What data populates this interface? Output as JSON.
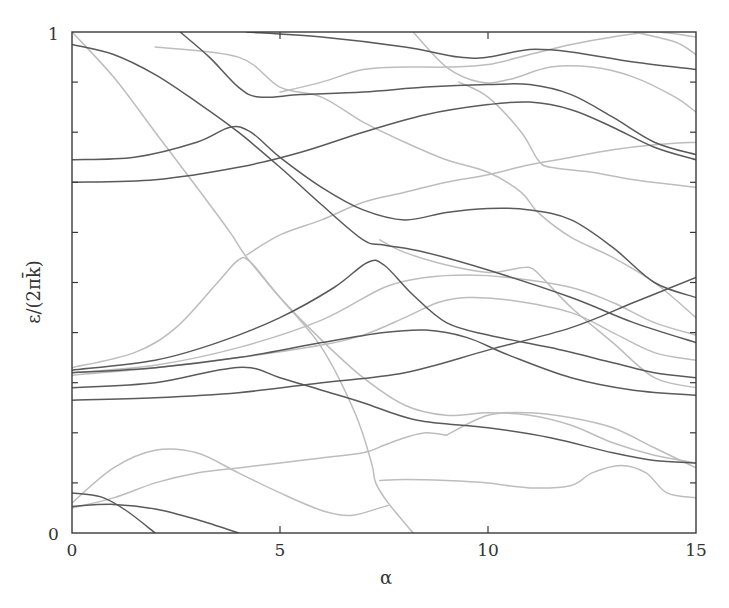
{
  "chart_data": {
    "type": "line",
    "title": "",
    "xlabel": "α",
    "ylabel": "ε/(2πk̄)",
    "xlim": [
      0,
      15
    ],
    "ylim": [
      0,
      1
    ],
    "x_ticks": [
      0,
      5,
      10,
      15
    ],
    "x_tick_labels": [
      "0",
      "5",
      "10",
      "15"
    ],
    "x_minor_ticks": [
      5,
      10
    ],
    "y_tick_labels": [
      "0",
      "1"
    ],
    "y_minor_ticks": [
      0.1,
      0.2,
      0.3,
      0.4,
      0.5,
      0.6,
      0.7,
      0.8,
      0.9
    ],
    "grid": false,
    "legend": null,
    "colors": {
      "dark": "#5a5a5a",
      "light": "#bdbdbd",
      "frame": "#3a3a3a"
    },
    "series": [
      {
        "name": "dark-1",
        "shade": "dark",
        "points": [
          [
            0,
            0.975
          ],
          [
            1,
            0.955
          ],
          [
            2,
            0.915
          ],
          [
            3,
            0.86
          ],
          [
            4,
            0.8
          ],
          [
            5,
            0.73
          ],
          [
            6,
            0.655
          ],
          [
            7,
            0.585
          ],
          [
            7.5,
            0.575
          ],
          [
            8.5,
            0.56
          ],
          [
            10,
            0.525
          ],
          [
            12,
            0.47
          ],
          [
            13.5,
            0.42
          ],
          [
            15,
            0.38
          ]
        ]
      },
      {
        "name": "dark-2",
        "shade": "dark",
        "points": [
          [
            2.6,
            1.0
          ],
          [
            3.3,
            0.95
          ],
          [
            4,
            0.89
          ],
          [
            4.5,
            0.87
          ],
          [
            5.5,
            0.875
          ],
          [
            7,
            0.88
          ],
          [
            8.5,
            0.89
          ],
          [
            10,
            0.895
          ],
          [
            11,
            0.895
          ],
          [
            12,
            0.875
          ],
          [
            13,
            0.83
          ],
          [
            14,
            0.78
          ],
          [
            15,
            0.755
          ]
        ]
      },
      {
        "name": "dark-3",
        "shade": "dark",
        "points": [
          [
            0,
            0.745
          ],
          [
            1.5,
            0.75
          ],
          [
            3,
            0.78
          ],
          [
            3.8,
            0.81
          ],
          [
            4.3,
            0.8
          ],
          [
            5,
            0.75
          ],
          [
            6,
            0.69
          ],
          [
            7,
            0.645
          ],
          [
            8,
            0.625
          ],
          [
            9,
            0.64
          ],
          [
            10,
            0.648
          ],
          [
            11,
            0.645
          ],
          [
            12,
            0.625
          ],
          [
            13,
            0.57
          ],
          [
            14,
            0.5
          ],
          [
            15,
            0.47
          ]
        ]
      },
      {
        "name": "dark-4",
        "shade": "dark",
        "points": [
          [
            0,
            0.7
          ],
          [
            2,
            0.705
          ],
          [
            4,
            0.73
          ],
          [
            5.5,
            0.76
          ],
          [
            7,
            0.8
          ],
          [
            8.5,
            0.835
          ],
          [
            10,
            0.855
          ],
          [
            11,
            0.86
          ],
          [
            12,
            0.845
          ],
          [
            13,
            0.81
          ],
          [
            14,
            0.77
          ],
          [
            15,
            0.745
          ]
        ]
      },
      {
        "name": "dark-5",
        "shade": "dark",
        "points": [
          [
            4.2,
            1.0
          ],
          [
            6,
            0.99
          ],
          [
            8,
            0.97
          ],
          [
            9.3,
            0.95
          ],
          [
            10,
            0.95
          ],
          [
            11,
            0.965
          ],
          [
            12,
            0.96
          ],
          [
            13.5,
            0.94
          ],
          [
            15,
            0.925
          ]
        ]
      },
      {
        "name": "dark-6",
        "shade": "dark",
        "points": [
          [
            0,
            0.325
          ],
          [
            2,
            0.345
          ],
          [
            3.5,
            0.38
          ],
          [
            5,
            0.43
          ],
          [
            6.3,
            0.49
          ],
          [
            7.1,
            0.54
          ],
          [
            7.5,
            0.535
          ],
          [
            8.2,
            0.475
          ],
          [
            9,
            0.42
          ],
          [
            10,
            0.395
          ],
          [
            11.5,
            0.37
          ],
          [
            13,
            0.34
          ],
          [
            14,
            0.32
          ],
          [
            15,
            0.31
          ]
        ]
      },
      {
        "name": "dark-7",
        "shade": "dark",
        "points": [
          [
            0,
            0.32
          ],
          [
            2,
            0.33
          ],
          [
            4,
            0.35
          ],
          [
            6,
            0.38
          ],
          [
            7.5,
            0.4
          ],
          [
            8.5,
            0.405
          ],
          [
            9.5,
            0.39
          ],
          [
            10.5,
            0.355
          ],
          [
            12,
            0.31
          ],
          [
            13.5,
            0.285
          ],
          [
            15,
            0.275
          ]
        ]
      },
      {
        "name": "dark-8",
        "shade": "dark",
        "points": [
          [
            0,
            0.29
          ],
          [
            2,
            0.3
          ],
          [
            3.5,
            0.325
          ],
          [
            4.3,
            0.33
          ],
          [
            5,
            0.31
          ],
          [
            6,
            0.285
          ],
          [
            7,
            0.26
          ],
          [
            8.3,
            0.225
          ],
          [
            10,
            0.21
          ],
          [
            11.5,
            0.19
          ],
          [
            13,
            0.16
          ],
          [
            14,
            0.145
          ],
          [
            15,
            0.14
          ]
        ]
      },
      {
        "name": "dark-9",
        "shade": "dark",
        "points": [
          [
            0,
            0.265
          ],
          [
            2,
            0.27
          ],
          [
            4,
            0.28
          ],
          [
            6,
            0.3
          ],
          [
            8,
            0.32
          ],
          [
            10,
            0.365
          ],
          [
            12,
            0.41
          ],
          [
            13.5,
            0.46
          ],
          [
            15,
            0.51
          ]
        ]
      },
      {
        "name": "dark-10",
        "shade": "dark",
        "points": [
          [
            0,
            0.08
          ],
          [
            0.7,
            0.072
          ],
          [
            1.3,
            0.045
          ],
          [
            2,
            0.0
          ]
        ]
      },
      {
        "name": "dark-11",
        "shade": "dark",
        "points": [
          [
            0,
            0.053
          ],
          [
            1,
            0.057
          ],
          [
            2,
            0.048
          ],
          [
            3,
            0.027
          ],
          [
            4,
            0.0
          ]
        ]
      },
      {
        "name": "light-1",
        "shade": "light",
        "points": [
          [
            0,
            1.0
          ],
          [
            1,
            0.91
          ],
          [
            2,
            0.8
          ],
          [
            3,
            0.69
          ],
          [
            3.8,
            0.6
          ],
          [
            4.2,
            0.55
          ],
          [
            5,
            0.47
          ],
          [
            6,
            0.37
          ],
          [
            6.8,
            0.24
          ],
          [
            7.2,
            0.14
          ],
          [
            7.3,
            0.1
          ],
          [
            7.6,
            0.06
          ],
          [
            8.2,
            0.0
          ]
        ]
      },
      {
        "name": "light-2",
        "shade": "light",
        "points": [
          [
            4.2,
            0.555
          ],
          [
            5,
            0.595
          ],
          [
            6,
            0.625
          ],
          [
            7,
            0.66
          ],
          [
            8,
            0.68
          ],
          [
            9,
            0.7
          ],
          [
            10,
            0.715
          ],
          [
            11,
            0.735
          ],
          [
            12,
            0.75
          ],
          [
            13,
            0.765
          ],
          [
            14,
            0.775
          ],
          [
            15,
            0.78
          ]
        ]
      },
      {
        "name": "light-3",
        "shade": "light",
        "points": [
          [
            0,
            0.33
          ],
          [
            1.5,
            0.36
          ],
          [
            2.5,
            0.41
          ],
          [
            3.5,
            0.5
          ],
          [
            4,
            0.545
          ],
          [
            4.3,
            0.54
          ],
          [
            5,
            0.47
          ],
          [
            6,
            0.385
          ],
          [
            7,
            0.31
          ],
          [
            8,
            0.255
          ],
          [
            9,
            0.235
          ],
          [
            10,
            0.24
          ],
          [
            11,
            0.235
          ],
          [
            12,
            0.215
          ],
          [
            13,
            0.18
          ],
          [
            14,
            0.155
          ],
          [
            15,
            0.14
          ]
        ]
      },
      {
        "name": "light-4",
        "shade": "light",
        "points": [
          [
            0,
            0.32
          ],
          [
            2,
            0.335
          ],
          [
            4,
            0.37
          ],
          [
            6,
            0.425
          ],
          [
            7.5,
            0.49
          ],
          [
            8.5,
            0.51
          ],
          [
            9.5,
            0.515
          ],
          [
            10.5,
            0.51
          ],
          [
            12,
            0.49
          ],
          [
            13,
            0.46
          ],
          [
            14,
            0.42
          ],
          [
            15,
            0.395
          ]
        ]
      },
      {
        "name": "light-5",
        "shade": "light",
        "points": [
          [
            0,
            0.315
          ],
          [
            2,
            0.33
          ],
          [
            4,
            0.35
          ],
          [
            6,
            0.375
          ],
          [
            7,
            0.395
          ],
          [
            8,
            0.43
          ],
          [
            8.8,
            0.46
          ],
          [
            9.5,
            0.47
          ],
          [
            10.5,
            0.465
          ],
          [
            12,
            0.44
          ],
          [
            13,
            0.4
          ],
          [
            14,
            0.36
          ],
          [
            15,
            0.345
          ]
        ]
      },
      {
        "name": "light-6",
        "shade": "light",
        "points": [
          [
            0,
            0.06
          ],
          [
            1,
            0.13
          ],
          [
            2,
            0.165
          ],
          [
            3,
            0.16
          ],
          [
            4,
            0.12
          ],
          [
            5,
            0.08
          ],
          [
            6,
            0.045
          ],
          [
            6.7,
            0.035
          ],
          [
            7.4,
            0.05
          ],
          [
            7.6,
            0.055
          ]
        ]
      },
      {
        "name": "light-7",
        "shade": "light",
        "points": [
          [
            0,
            0.05
          ],
          [
            1,
            0.07
          ],
          [
            2,
            0.1
          ],
          [
            3,
            0.12
          ],
          [
            4,
            0.13
          ],
          [
            5,
            0.14
          ],
          [
            6,
            0.15
          ],
          [
            7,
            0.16
          ],
          [
            7.5,
            0.175
          ],
          [
            8,
            0.19
          ],
          [
            8.5,
            0.2
          ],
          [
            9,
            0.195
          ]
        ]
      },
      {
        "name": "light-8",
        "shade": "light",
        "points": [
          [
            7.4,
            0.105
          ],
          [
            8,
            0.107
          ],
          [
            9,
            0.105
          ],
          [
            10,
            0.1
          ],
          [
            11,
            0.09
          ],
          [
            12,
            0.095
          ],
          [
            12.5,
            0.12
          ],
          [
            13.2,
            0.135
          ],
          [
            13.8,
            0.12
          ],
          [
            14.3,
            0.08
          ],
          [
            15,
            0.07
          ]
        ]
      },
      {
        "name": "light-9",
        "shade": "light",
        "points": [
          [
            9,
            0.195
          ],
          [
            10,
            0.235
          ],
          [
            11,
            0.24
          ],
          [
            12,
            0.23
          ],
          [
            13,
            0.21
          ],
          [
            14,
            0.17
          ],
          [
            15,
            0.13
          ]
        ]
      },
      {
        "name": "light-10",
        "shade": "light",
        "points": [
          [
            7.4,
            0.585
          ],
          [
            8,
            0.56
          ],
          [
            9,
            0.535
          ],
          [
            10,
            0.52
          ],
          [
            10.5,
            0.525
          ],
          [
            11,
            0.53
          ],
          [
            11.3,
            0.51
          ],
          [
            12,
            0.45
          ],
          [
            13,
            0.38
          ],
          [
            14,
            0.31
          ],
          [
            15,
            0.29
          ]
        ]
      },
      {
        "name": "light-11",
        "shade": "light",
        "points": [
          [
            9.3,
            0.9
          ],
          [
            10,
            0.87
          ],
          [
            10.8,
            0.8
          ],
          [
            11.2,
            0.745
          ],
          [
            11.5,
            0.73
          ],
          [
            12.5,
            0.72
          ],
          [
            13.5,
            0.705
          ],
          [
            15,
            0.69
          ]
        ]
      },
      {
        "name": "light-12",
        "shade": "light",
        "points": [
          [
            2,
            0.97
          ],
          [
            4,
            0.95
          ],
          [
            5,
            0.89
          ],
          [
            6,
            0.87
          ],
          [
            7,
            0.82
          ],
          [
            8,
            0.78
          ],
          [
            9,
            0.745
          ],
          [
            10,
            0.72
          ],
          [
            10.8,
            0.68
          ],
          [
            11.2,
            0.64
          ],
          [
            12,
            0.59
          ],
          [
            13,
            0.55
          ],
          [
            14,
            0.5
          ],
          [
            15,
            0.43
          ]
        ]
      },
      {
        "name": "light-13",
        "shade": "light",
        "points": [
          [
            5,
            0.88
          ],
          [
            6,
            0.9
          ],
          [
            7,
            0.925
          ],
          [
            8,
            0.93
          ],
          [
            9,
            0.93
          ],
          [
            10,
            0.935
          ],
          [
            11,
            0.955
          ],
          [
            12,
            0.975
          ],
          [
            13,
            0.99
          ],
          [
            14,
            1.0
          ],
          [
            15,
            0.99
          ]
        ]
      },
      {
        "name": "light-14",
        "shade": "light",
        "points": [
          [
            8.2,
            1.0
          ],
          [
            9,
            0.93
          ],
          [
            9.8,
            0.9
          ],
          [
            10.5,
            0.905
          ],
          [
            11.5,
            0.93
          ],
          [
            12.5,
            0.93
          ],
          [
            13.5,
            0.91
          ],
          [
            14.5,
            0.87
          ],
          [
            15,
            0.84
          ]
        ]
      },
      {
        "name": "light-15",
        "shade": "light",
        "points": [
          [
            13.5,
            1.0
          ],
          [
            14.5,
            0.98
          ],
          [
            15,
            0.955
          ]
        ]
      }
    ]
  },
  "axes": {
    "x_label": "α",
    "y_label": "ε/(2πk̄)",
    "x_tick_0": "0",
    "x_tick_5": "5",
    "x_tick_10": "10",
    "x_tick_15": "15",
    "y_tick_0": "0",
    "y_tick_1": "1"
  }
}
